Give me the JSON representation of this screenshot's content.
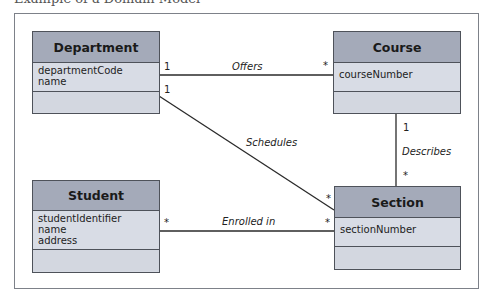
{
  "title": "Example of a Domain Model",
  "classes": {
    "department": {
      "name": "Department",
      "attributes": [
        "departmentCode",
        "name"
      ]
    },
    "course": {
      "name": "Course",
      "attributes": [
        "courseNumber"
      ]
    },
    "student": {
      "name": "Student",
      "attributes": [
        "studentIdentifier",
        "name",
        "address"
      ]
    },
    "section": {
      "name": "Section",
      "attributes": [
        "sectionNumber"
      ]
    }
  },
  "associations": {
    "offers": {
      "name": "Offers",
      "from": "Department",
      "to": "Course",
      "from_mult": "1",
      "to_mult": "*"
    },
    "schedules": {
      "name": "Schedules",
      "from": "Department",
      "to": "Section",
      "from_mult": "1",
      "to_mult": "*"
    },
    "describes": {
      "name": "Describes",
      "from": "Course",
      "to": "Section",
      "from_mult": "1",
      "to_mult": "*"
    },
    "enrolled": {
      "name": "Enrolled in",
      "from": "Student",
      "to": "Section",
      "from_mult": "*",
      "to_mult": "*"
    }
  },
  "colors": {
    "header": "#a4aab9",
    "body": "#d6dae3",
    "border": "#4e525a",
    "frame": "#7d8189"
  }
}
